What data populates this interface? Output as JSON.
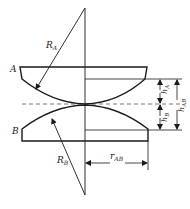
{
  "diagram": {
    "labels": {
      "body_a": "A",
      "body_b": "B",
      "radius_a": "R",
      "radius_a_sub": "A",
      "radius_b": "R",
      "radius_b_sub": "B",
      "height_a": "h",
      "height_a_sub": "A",
      "height_b": "h",
      "height_b_sub": "B",
      "height_ab": "h",
      "height_ab_sub": "AB",
      "radius_ab": "r",
      "radius_ab_sub": "AB"
    },
    "colors": {
      "stroke": "#1a1a1a",
      "dashed": "#666666",
      "background": "#ffffff"
    }
  }
}
